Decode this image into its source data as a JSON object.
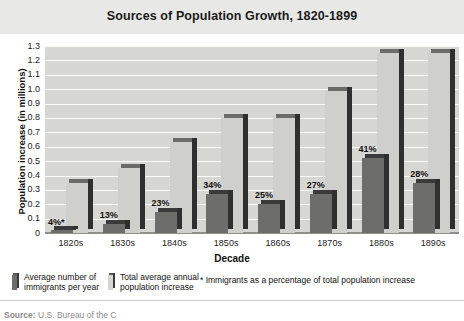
{
  "header": {
    "title": "Sources of Population Growth, 1820-1899"
  },
  "axes": {
    "y_title": "Population increase (in millions)",
    "x_title": "Decade"
  },
  "legend": {
    "items": [
      {
        "swatch": "dark",
        "line1": "Average number of",
        "line2": "immigrants per year"
      },
      {
        "swatch": "light",
        "line1": "Total average annual",
        "line2": "population increase"
      }
    ]
  },
  "footnote": "* Immigrants as a percentage of total population increase",
  "source": {
    "label": "Source:",
    "text": "U.S. Bureau of the C"
  },
  "chart_data": {
    "type": "bar",
    "title": "Sources of Population Growth, 1820-1899",
    "xlabel": "Decade",
    "ylabel": "Population increase (in millions)",
    "ylim": [
      0,
      1.3
    ],
    "yticks": [
      "1.3",
      "1.2",
      "1.1",
      "1.0",
      "0.9",
      "0.8",
      "0.7",
      "0.6",
      "0.5",
      "0.4",
      "0.3",
      "0.2",
      "0.1",
      "0"
    ],
    "grid": true,
    "legend_position": "below",
    "categories": [
      "1820s",
      "1830s",
      "1840s",
      "1850s",
      "1860s",
      "1870s",
      "1880s",
      "1890s"
    ],
    "series": [
      {
        "name": "Average number of immigrants per year",
        "values": [
          0.014,
          0.06,
          0.145,
          0.27,
          0.2,
          0.27,
          0.52,
          0.35
        ]
      },
      {
        "name": "Total average annual population increase",
        "values": [
          0.35,
          0.45,
          0.63,
          0.8,
          0.8,
          0.99,
          1.25,
          1.25
        ]
      }
    ],
    "annotations": [
      "4%*",
      "13%",
      "23%",
      "34%",
      "25%",
      "27%",
      "41%",
      "28%"
    ]
  }
}
